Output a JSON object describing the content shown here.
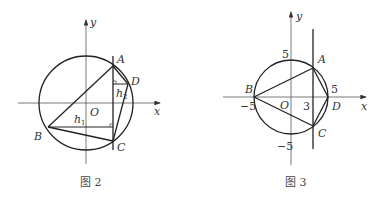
{
  "figures": [
    {
      "caption": "图 2",
      "axis_x": "x",
      "axis_y": "y",
      "origin": "O",
      "points": {
        "A": "A",
        "B": "B",
        "C": "C",
        "D": "D"
      },
      "heights": {
        "h1": "h",
        "h1_sub": "1",
        "h2": "h",
        "h2_sub": "2"
      }
    },
    {
      "caption": "图 3",
      "axis_x": "x",
      "axis_y": "y",
      "origin": "O",
      "points": {
        "A": "A",
        "B": "B",
        "C": "C",
        "D": "D"
      },
      "ticks": {
        "y_pos": "5",
        "y_neg": "−5",
        "x_neg": "−5",
        "x_pos": "5",
        "x_three": "3"
      }
    }
  ]
}
